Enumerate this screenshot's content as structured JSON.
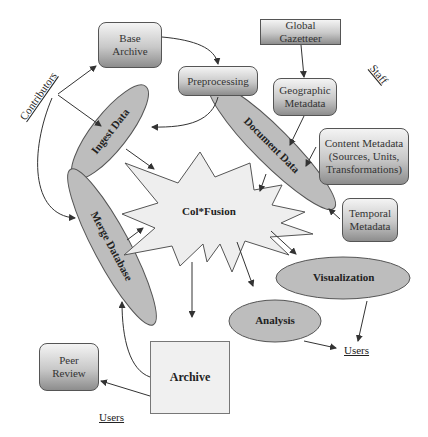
{
  "diagram": {
    "core": {
      "label": "Col*Fusion"
    },
    "boxes": {
      "base_archive": "Base Archive",
      "preprocessing": "Preprocessing",
      "global_gazetteer": "Global Gazetteer",
      "geographic_metadata": "Geographic Metadata",
      "content_metadata": "Content Metadata (Sources, Units, Transformations)",
      "temporal_metadata": "Temporal Metadata",
      "peer_review": "Peer Review",
      "archive": "Archive"
    },
    "ellipses": {
      "ingest_data": "Ingest Data",
      "document_data": "Document Data",
      "merge_database": "Merge Database",
      "visualization": "Visualization",
      "analysis": "Analysis"
    },
    "roles": {
      "contributors": "Contributors",
      "staff": "Staff",
      "users_right": "Users",
      "users_bottom": "Users"
    },
    "colors": {
      "ellipse_fill": "#bdbdbd",
      "star_fill": "#eeeeee",
      "stroke": "#555555"
    }
  }
}
